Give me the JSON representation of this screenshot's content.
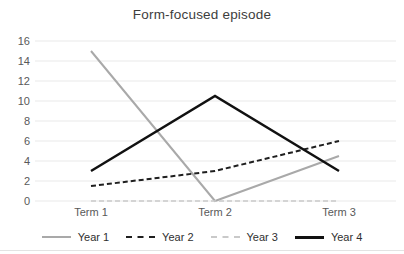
{
  "chart_data": {
    "type": "line",
    "title": "Form-focused episode",
    "categories": [
      "Term 1",
      "Term 2",
      "Term 3"
    ],
    "series": [
      {
        "name": "Year 1",
        "values": [
          15,
          0,
          4.5
        ],
        "color": "#a9a9a9",
        "style": "solid",
        "width": 2
      },
      {
        "name": "Year 2",
        "values": [
          1.5,
          3,
          6
        ],
        "color": "#1f1f1f",
        "style": "dashed",
        "width": 2
      },
      {
        "name": "Year 3",
        "values": [
          0,
          0,
          0
        ],
        "color": "#c9c9c9",
        "style": "dashed",
        "width": 1.5
      },
      {
        "name": "Year 4",
        "values": [
          3,
          10.5,
          3
        ],
        "color": "#111111",
        "style": "solid",
        "width": 2.5
      }
    ],
    "ylim": [
      0,
      16
    ],
    "ytick_step": 2,
    "ytick_labels": [
      "0",
      "2",
      "4",
      "6",
      "8",
      "10",
      "12",
      "14",
      "16"
    ],
    "xlabel": "",
    "ylabel": "",
    "grid": true,
    "legend_position": "bottom",
    "colors": {
      "title": "#3d3d3d",
      "axis_labels": "#595959",
      "gridlines": "#e9e9e9",
      "background": "#ffffff"
    }
  }
}
